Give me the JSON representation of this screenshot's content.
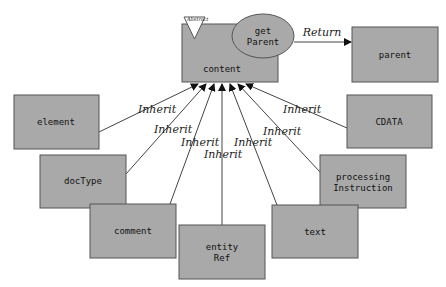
{
  "diagram": {
    "nodes": {
      "content": {
        "label": "content",
        "stereotype": "Abstract"
      },
      "getParent": {
        "label_line1": "get",
        "label_line2": "Parent"
      },
      "parent": {
        "label": "parent"
      },
      "element": {
        "label": "element"
      },
      "CDATA": {
        "label": "CDATA"
      },
      "docType": {
        "label": "docType"
      },
      "processingInstruction": {
        "label_line1": "processing",
        "label_line2": "Instruction"
      },
      "comment": {
        "label": "comment"
      },
      "entityRef": {
        "label_line1": "entity",
        "label_line2": "Ref"
      },
      "text": {
        "label": "text"
      }
    },
    "edges": {
      "return_label": "Return",
      "inherit_label": "Inherit"
    },
    "colors": {
      "box_fill": "#a9a9a9",
      "box_stroke": "#555555",
      "background": "#ffffff"
    }
  }
}
